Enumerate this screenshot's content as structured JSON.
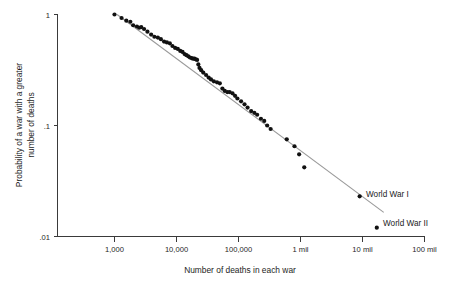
{
  "chart_data": {
    "type": "scatter",
    "title": "",
    "xlabel": "Number of deaths in each war",
    "ylabel": "Probability of a war with a greater number of deaths",
    "ylabel_line1": "Probability of a war with a greater",
    "ylabel_line2": "number of  deaths",
    "xscale": "log",
    "yscale": "log",
    "xlim": [
      1000,
      100000000
    ],
    "ylim": [
      0.01,
      1
    ],
    "grid": false,
    "legend": "none",
    "xticks": [
      {
        "value": 1000,
        "label": "1,000"
      },
      {
        "value": 10000,
        "label": "10,000"
      },
      {
        "value": 100000,
        "label": "100,000"
      },
      {
        "value": 1000000,
        "label": "1 mil"
      },
      {
        "value": 10000000,
        "label": "10 mil"
      },
      {
        "value": 100000000,
        "label": "100 mil"
      }
    ],
    "yticks": [
      {
        "value": 1,
        "label": "1"
      },
      {
        "value": 0.1,
        "label": ".1"
      },
      {
        "value": 0.01,
        "label": ".01"
      }
    ],
    "series": [
      {
        "name": "wars",
        "marker": "circle",
        "color": "#111111",
        "points": [
          [
            1000,
            1.0
          ],
          [
            1300,
            0.93
          ],
          [
            1550,
            0.88
          ],
          [
            1800,
            0.86
          ],
          [
            2000,
            0.8
          ],
          [
            2300,
            0.78
          ],
          [
            2500,
            0.76
          ],
          [
            2700,
            0.77
          ],
          [
            3000,
            0.74
          ],
          [
            3400,
            0.7
          ],
          [
            3900,
            0.66
          ],
          [
            4400,
            0.63
          ],
          [
            5000,
            0.62
          ],
          [
            5600,
            0.6
          ],
          [
            6300,
            0.57
          ],
          [
            7000,
            0.56
          ],
          [
            7800,
            0.55
          ],
          [
            8600,
            0.52
          ],
          [
            9500,
            0.5
          ],
          [
            10500,
            0.49
          ],
          [
            11500,
            0.47
          ],
          [
            12500,
            0.46
          ],
          [
            13500,
            0.44
          ],
          [
            14500,
            0.43
          ],
          [
            15500,
            0.42
          ],
          [
            16500,
            0.41
          ],
          [
            17500,
            0.405
          ],
          [
            18500,
            0.4
          ],
          [
            19500,
            0.4
          ],
          [
            20500,
            0.395
          ],
          [
            21500,
            0.39
          ],
          [
            22500,
            0.355
          ],
          [
            23500,
            0.33
          ],
          [
            25000,
            0.315
          ],
          [
            27000,
            0.3
          ],
          [
            30000,
            0.285
          ],
          [
            33000,
            0.27
          ],
          [
            36000,
            0.26
          ],
          [
            40000,
            0.25
          ],
          [
            45000,
            0.245
          ],
          [
            50000,
            0.24
          ],
          [
            55000,
            0.215
          ],
          [
            60000,
            0.205
          ],
          [
            66000,
            0.2
          ],
          [
            72000,
            0.2
          ],
          [
            80000,
            0.195
          ],
          [
            88000,
            0.185
          ],
          [
            96000,
            0.175
          ],
          [
            110000,
            0.165
          ],
          [
            125000,
            0.155
          ],
          [
            140000,
            0.145
          ],
          [
            160000,
            0.135
          ],
          [
            180000,
            0.13
          ],
          [
            200000,
            0.125
          ],
          [
            230000,
            0.115
          ],
          [
            260000,
            0.11
          ],
          [
            290000,
            0.1
          ],
          [
            330000,
            0.093
          ],
          [
            600000,
            0.075
          ],
          [
            800000,
            0.065
          ],
          [
            950000,
            0.055
          ],
          [
            1150000,
            0.042
          ],
          [
            9000000,
            0.023
          ],
          [
            17000000,
            0.012
          ]
        ]
      }
    ],
    "trend_line": {
      "name": "power-law fit",
      "color": "#9a9a9a",
      "start": [
        1100,
        1.0
      ],
      "end": [
        22000000,
        0.0165
      ]
    },
    "annotations": [
      {
        "label": "World War I",
        "x": 9000000,
        "y": 0.023
      },
      {
        "label": "World War II",
        "x": 17000000,
        "y": 0.012
      }
    ]
  }
}
